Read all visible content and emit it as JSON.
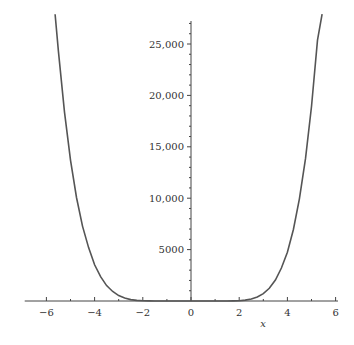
{
  "chart_data": {
    "type": "line",
    "title": "",
    "xlabel": "x",
    "ylabel": "",
    "xlim": [
      -7,
      6.5
    ],
    "ylim": [
      0,
      27500
    ],
    "grid": false,
    "legend": null,
    "x_ticks": [
      -6,
      -4,
      -2,
      0,
      2,
      4,
      6
    ],
    "x_tick_labels": [
      "−6",
      "−4",
      "−2",
      "0",
      "2",
      "4",
      "6"
    ],
    "y_ticks": [
      5000,
      10000,
      15000,
      20000,
      25000
    ],
    "y_tick_labels": [
      "5000",
      "10,000",
      "15,000",
      "20,000",
      "25,000"
    ],
    "series": [
      {
        "name": "f(x)",
        "color": "#555555",
        "x": [
          -5.64,
          -5.5,
          -5.25,
          -5.0,
          -4.75,
          -4.5,
          -4.25,
          -4.0,
          -3.75,
          -3.5,
          -3.25,
          -3.0,
          -2.75,
          -2.5,
          -2.25,
          -2.0,
          -1.75,
          -1.5,
          -1.0,
          -0.5,
          0.0,
          0.5,
          1.0,
          1.5,
          1.75,
          2.0,
          2.25,
          2.5,
          2.75,
          3.0,
          3.25,
          3.5,
          3.75,
          4.0,
          4.25,
          4.5,
          4.75,
          5.0,
          5.25,
          5.44
        ],
        "y": [
          27900,
          24310,
          18380,
          13710,
          10070,
          7290,
          5190,
          3520,
          2360,
          1500,
          920,
          530,
          290,
          140,
          60,
          20,
          10,
          0,
          0,
          0,
          0,
          0,
          0,
          0,
          10,
          30,
          90,
          190,
          400,
          720,
          1240,
          2040,
          3210,
          4750,
          6960,
          9940,
          13840,
          18920,
          25380,
          27900
        ]
      }
    ]
  }
}
